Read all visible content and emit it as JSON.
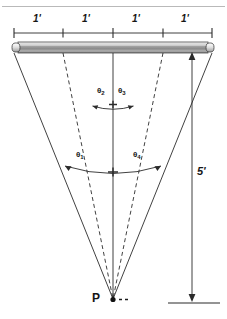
{
  "figure": {
    "title_rule_visible": true,
    "point_label": "P",
    "height_label": "5'",
    "segment_labels": [
      "1'",
      "1'",
      "1'",
      "1'"
    ],
    "angle_labels": {
      "theta1_symbol": "θ",
      "theta1_sub": "1",
      "theta2_symbol": "θ",
      "theta2_sub": "2",
      "theta3_symbol": "θ",
      "theta3_sub": "3",
      "theta4_symbol": "θ",
      "theta4_sub": "4"
    },
    "colors": {
      "ink": "#1a1a1a",
      "line": "#2b2b2b",
      "tube_light": "#f2f2f2",
      "tube_mid": "#9a9a9a",
      "tube_dark": "#6e6e6e",
      "paper": "#ffffff",
      "faint_rule": "#b9b9b9"
    },
    "geometry": {
      "tube_left_x": 12,
      "tube_right_x": 214,
      "tube_y": 48,
      "point_x": 113,
      "point_y": 299,
      "ray_tops_x": [
        14,
        63,
        113,
        163,
        212
      ],
      "dimension_line_y": 33,
      "tick_xs": [
        14,
        63,
        113,
        163,
        212
      ],
      "height_line_x": 192,
      "height_top_y": 52,
      "height_bottom_y": 302,
      "ground_y": 303
    }
  }
}
